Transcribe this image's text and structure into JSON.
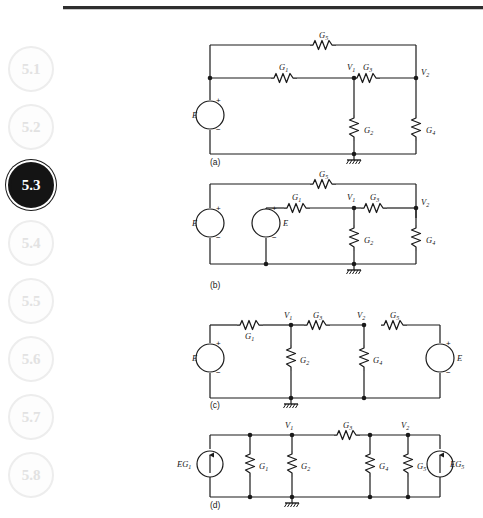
{
  "page": {
    "background_color": "#ffffff",
    "rule_color": "#2e2e2e"
  },
  "sidebar": {
    "active_index": 2,
    "items": [
      {
        "label": "5.1",
        "active": false
      },
      {
        "label": "5.2",
        "active": false
      },
      {
        "label": "5.3",
        "active": true
      },
      {
        "label": "5.4",
        "active": false
      },
      {
        "label": "5.5",
        "active": false
      },
      {
        "label": "5.6",
        "active": false
      },
      {
        "label": "5.7",
        "active": false
      },
      {
        "label": "5.8",
        "active": false
      }
    ]
  },
  "figure": {
    "panels": [
      {
        "id": "a",
        "caption": "(a)",
        "sources": [
          {
            "name": "E",
            "type": "voltage",
            "plus": "+",
            "minus": "−"
          }
        ],
        "nodes": [
          "V1",
          "V2"
        ],
        "resistors": [
          "G1",
          "G2",
          "G3",
          "G4",
          "G5"
        ],
        "ground": true,
        "labels": {
          "G1": "G₁",
          "G2": "G₂",
          "G3": "G₃",
          "G4": "G₄",
          "G5": "G₅",
          "V1": "V₁",
          "V2": "V₂",
          "E": "E",
          "plus": "+",
          "minus": "−"
        }
      },
      {
        "id": "b",
        "caption": "(b)",
        "sources": [
          {
            "name": "E",
            "type": "voltage",
            "plus": "+",
            "minus": "−"
          },
          {
            "name": "E",
            "type": "voltage",
            "plus": "+",
            "minus": "−"
          }
        ],
        "nodes": [
          "V1",
          "V2"
        ],
        "resistors": [
          "G1",
          "G2",
          "G3",
          "G4",
          "G5"
        ],
        "ground": true,
        "labels": {
          "G1": "G₁",
          "G2": "G₂",
          "G3": "G₃",
          "G4": "G₄",
          "G5": "G₅",
          "V1": "V₁",
          "V2": "V₂",
          "E_left": "E",
          "E_mid": "E",
          "plus": "+",
          "minus": "−"
        }
      },
      {
        "id": "c",
        "caption": "(c)",
        "sources": [
          {
            "name": "E",
            "type": "voltage",
            "plus": "+",
            "minus": "−"
          },
          {
            "name": "E",
            "type": "voltage",
            "plus": "+",
            "minus": "−"
          }
        ],
        "nodes": [
          "V1",
          "V2"
        ],
        "resistors": [
          "G1",
          "G2",
          "G3",
          "G4",
          "G5"
        ],
        "ground": true,
        "labels": {
          "G1": "G₁",
          "G2": "G₂",
          "G3": "G₃",
          "G4": "G₄",
          "G5": "G₅",
          "V1": "V₁",
          "V2": "V₂",
          "E_left": "E",
          "E_right": "E",
          "plus": "+",
          "minus": "−"
        }
      },
      {
        "id": "d",
        "caption": "(d)",
        "sources": [
          {
            "name": "EG1",
            "type": "current",
            "label": "EG₁"
          },
          {
            "name": "EG5",
            "type": "current",
            "label": "EG₅"
          }
        ],
        "nodes": [
          "V1",
          "V2"
        ],
        "resistors": [
          "G1",
          "G2",
          "G3",
          "G4",
          "G5"
        ],
        "ground": true,
        "labels": {
          "G1": "G₁",
          "G2": "G₂",
          "G3": "G₃",
          "G4": "G₄",
          "G5": "G₅",
          "V1": "V₁",
          "V2": "V₂",
          "src_left": "EG₁",
          "src_right": "EG₅"
        }
      }
    ]
  }
}
